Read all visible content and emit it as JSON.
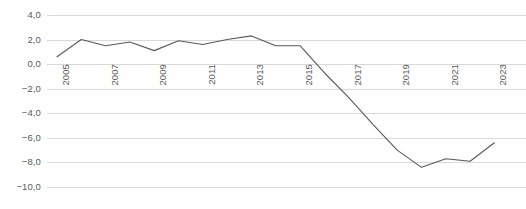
{
  "chart_data": {
    "type": "line",
    "title": "",
    "subtitle": "",
    "xlabel": "",
    "ylabel": "",
    "x": [
      2005,
      2006,
      2007,
      2008,
      2009,
      2010,
      2011,
      2012,
      2013,
      2014,
      2015,
      2016,
      2017,
      2018,
      2019,
      2020,
      2021,
      2022,
      2023
    ],
    "values": [
      0.6,
      2.0,
      1.5,
      1.8,
      1.1,
      1.9,
      1.6,
      2.0,
      2.3,
      1.5,
      1.5,
      -0.7,
      -2.7,
      -4.9,
      -7.0,
      -8.4,
      -7.7,
      -7.9,
      -6.4
    ],
    "series": [
      {
        "name": "",
        "color": "#595959",
        "values": [
          0.6,
          2.0,
          1.5,
          1.8,
          1.1,
          1.9,
          1.6,
          2.0,
          2.3,
          1.5,
          1.5,
          -0.7,
          -2.7,
          -4.9,
          -7.0,
          -8.4,
          -7.7,
          -7.9,
          -6.4
        ]
      }
    ],
    "ylim": [
      -10.0,
      4.0
    ],
    "xlim": [
      2005,
      2023
    ],
    "y_ticks": [
      4.0,
      2.0,
      0.0,
      -2.0,
      -4.0,
      -6.0,
      -8.0,
      -10.0
    ],
    "y_tick_labels": [
      "4,0",
      "2,0",
      "0,0",
      "−2,0",
      "−4,0",
      "−6,0",
      "−8,0",
      "−10,0"
    ],
    "x_ticks": [
      2005,
      2007,
      2009,
      2011,
      2013,
      2015,
      2017,
      2019,
      2021,
      2023
    ],
    "x_tick_labels": [
      "2005",
      "2007",
      "2009",
      "2011",
      "2013",
      "2015",
      "2017",
      "2019",
      "2021",
      "2023"
    ],
    "grid": true,
    "grid_color": "#d9d9d9",
    "legend": false,
    "legend_position": "none",
    "x_tick_rotation": -90,
    "annotations": []
  }
}
